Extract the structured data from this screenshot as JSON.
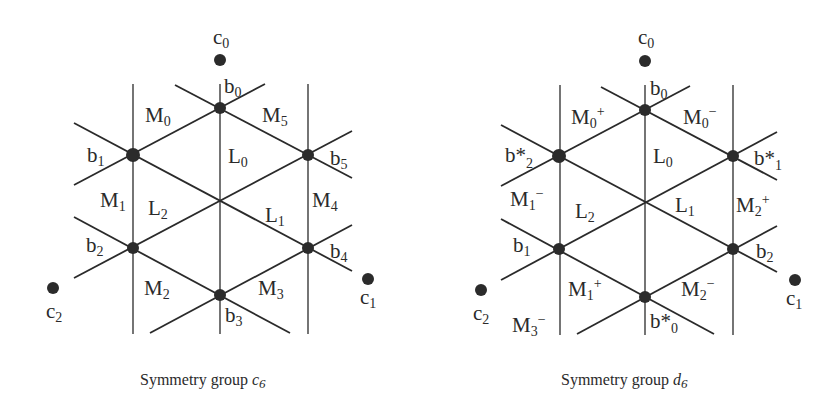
{
  "figure": {
    "background": "#ffffff",
    "ink_color": "#2a2a2a",
    "panels": [
      {
        "id": "c6",
        "caption": {
          "text": "Symmetry group ",
          "symbol": "c",
          "subscript": "6"
        },
        "points_c": [
          {
            "base": "c",
            "sub": "0"
          },
          {
            "base": "c",
            "sub": "1"
          },
          {
            "base": "c",
            "sub": "2"
          }
        ],
        "nodes_b": [
          {
            "base": "b",
            "sub": "0"
          },
          {
            "base": "b",
            "sub": "1"
          },
          {
            "base": "b",
            "sub": "2"
          },
          {
            "base": "b",
            "sub": "3"
          },
          {
            "base": "b",
            "sub": "4"
          },
          {
            "base": "b",
            "sub": "5"
          }
        ],
        "regions_L": [
          {
            "base": "L",
            "sub": "0"
          },
          {
            "base": "L",
            "sub": "1"
          },
          {
            "base": "L",
            "sub": "2"
          }
        ],
        "regions_M": [
          {
            "base": "M",
            "sub": "0",
            "sup": ""
          },
          {
            "base": "M",
            "sub": "1",
            "sup": ""
          },
          {
            "base": "M",
            "sub": "2",
            "sup": ""
          },
          {
            "base": "M",
            "sub": "3",
            "sup": ""
          },
          {
            "base": "M",
            "sub": "4",
            "sup": ""
          },
          {
            "base": "M",
            "sub": "5",
            "sup": ""
          }
        ]
      },
      {
        "id": "d6",
        "caption": {
          "text": "Symmetry group ",
          "symbol": "d",
          "subscript": "6"
        },
        "points_c": [
          {
            "base": "c",
            "sub": "0"
          },
          {
            "base": "c",
            "sub": "1"
          },
          {
            "base": "c",
            "sub": "2"
          }
        ],
        "nodes_b": [
          {
            "base": "b",
            "sub": "0"
          },
          {
            "base": "b*",
            "sub": "2"
          },
          {
            "base": "b*",
            "sub": "1"
          },
          {
            "base": "b",
            "sub": "1"
          },
          {
            "base": "b",
            "sub": "2"
          },
          {
            "base": "b*",
            "sub": "0"
          }
        ],
        "regions_L": [
          {
            "base": "L",
            "sub": "0"
          },
          {
            "base": "L",
            "sub": "1"
          },
          {
            "base": "L",
            "sub": "2"
          }
        ],
        "regions_M": [
          {
            "base": "M",
            "sub": "0",
            "sup": "+"
          },
          {
            "base": "M",
            "sub": "0",
            "sup": "−"
          },
          {
            "base": "M",
            "sub": "1",
            "sup": "−"
          },
          {
            "base": "M",
            "sub": "2",
            "sup": "+"
          },
          {
            "base": "M",
            "sub": "1",
            "sup": "+"
          },
          {
            "base": "M",
            "sub": "2",
            "sup": "−"
          },
          {
            "base": "M",
            "sub": "3",
            "sup": "−"
          }
        ]
      }
    ]
  }
}
